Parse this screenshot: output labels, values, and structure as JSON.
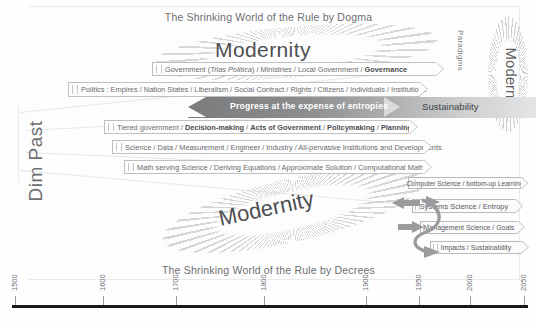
{
  "diagram": {
    "title_top": "The Shrinking World of the Rule by Dogma",
    "title_bottom": "The Shrinking World of the Rule by Decrees",
    "left_axis_label": "Dim Past",
    "right_label_paradigms": "Paradigms",
    "right_label_modernity": "Modernity",
    "modernity_top": "Modernity",
    "modernity_bottom": "Modernity"
  },
  "bars": [
    {
      "id": "government",
      "text": "Government (Trias Politica) / Ministries / Local Government / Governance"
    },
    {
      "id": "politics",
      "text": "Politics : Empires / Nation States / Liberalism / Social Contract / Rights / Citizens / Individuals / Institutions"
    },
    {
      "id": "tiered-government",
      "text": "Tiered government / Decision-making / Acts of Government / Policymaking / Planning"
    },
    {
      "id": "science",
      "text": "Science / Data / Measurement / Engineer / Industry / All-pervasive Institutions and Developments"
    },
    {
      "id": "math",
      "text": "Math serving Science / Deriving Equations / Approximate Solution / Computational Math"
    }
  ],
  "progress_band": {
    "progress_label": "Progress at the expense of entropies",
    "sustainability_label": "Sustainability"
  },
  "right_boxes": [
    {
      "id": "computer-science",
      "text": "Computer Science / bottom-up Learning"
    },
    {
      "id": "systems-science",
      "text": "Systems Science / Entropy"
    },
    {
      "id": "management-science",
      "text": "Management Science / Goals"
    },
    {
      "id": "impacts",
      "text": "Impacts / Sustainability"
    }
  ],
  "axis": {
    "ticks": [
      {
        "label": "1500",
        "x": 15
      },
      {
        "label": "1600",
        "x": 103
      },
      {
        "label": "1700",
        "x": 176
      },
      {
        "label": "1800",
        "x": 264
      },
      {
        "label": "1900",
        "x": 366
      },
      {
        "label": "1950",
        "x": 419
      },
      {
        "label": "2000",
        "x": 470
      },
      {
        "label": "2050",
        "x": 524
      }
    ]
  },
  "colors": {
    "band_dark": "#7a7b7d",
    "band_light": "#e3e4e6",
    "text": "#58595b",
    "border": "#bfc0c2"
  }
}
